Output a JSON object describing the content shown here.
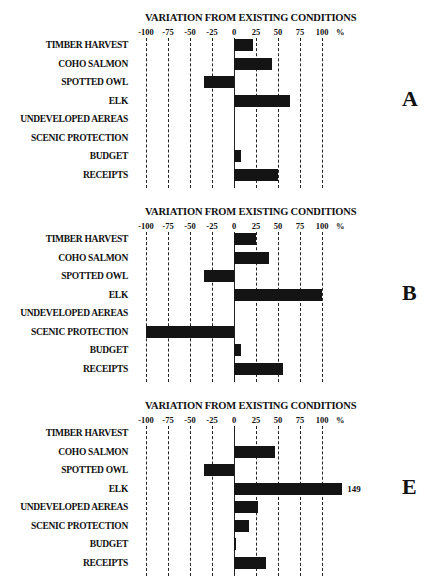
{
  "chart_data": [
    {
      "type": "bar",
      "orientation": "horizontal",
      "panel": "A",
      "title": "VARIATION FROM EXISTING CONDITIONS",
      "xlabel": "%",
      "xlim": [
        -100,
        100
      ],
      "xticks": [
        -100,
        -75,
        -50,
        -25,
        0,
        25,
        50,
        75,
        100
      ],
      "grid": "vertical dashed",
      "categories": [
        "TIMBER HARVEST",
        "COHO SALMON",
        "SPOTTED OWL",
        "ELK",
        "UNDEVELOPED AEREAS",
        "SCENIC PROTECTION",
        "BUDGET",
        "RECEIPTS"
      ],
      "values": [
        22,
        43,
        -34,
        64,
        0,
        0,
        8,
        50
      ]
    },
    {
      "type": "bar",
      "orientation": "horizontal",
      "panel": "B",
      "title": "VARIATION FROM EXISTING CONDITIONS",
      "xlabel": "%",
      "xlim": [
        -100,
        100
      ],
      "xticks": [
        -100,
        -75,
        -50,
        -25,
        0,
        25,
        50,
        75,
        100
      ],
      "grid": "vertical dashed",
      "categories": [
        "TIMBER HARVEST",
        "COHO SALMON",
        "SPOTTED OWL",
        "ELK",
        "UNDEVELOPED AEREAS",
        "SCENIC PROTECTION",
        "BUDGET",
        "RECEIPTS"
      ],
      "values": [
        25,
        40,
        -34,
        100,
        0,
        -100,
        8,
        56
      ]
    },
    {
      "type": "bar",
      "orientation": "horizontal",
      "panel": "E",
      "title": "VARIATION FROM EXISTING CONDITIONS",
      "xlabel": "%",
      "xlim": [
        -100,
        100
      ],
      "xticks": [
        -100,
        -75,
        -50,
        -25,
        0,
        25,
        50,
        75,
        100
      ],
      "grid": "vertical dashed",
      "categories": [
        "TIMBER HARVEST",
        "COHO SALMON",
        "SPOTTED OWL",
        "ELK",
        "UNDEVELOPED AEREAS",
        "SCENIC PROTECTION",
        "BUDGET",
        "RECEIPTS"
      ],
      "values": [
        0,
        47,
        -34,
        149,
        27,
        17,
        2,
        36
      ],
      "annotations": [
        {
          "category": "ELK",
          "text": "149",
          "note": "bar truncated beyond axis"
        }
      ]
    }
  ],
  "panels": [
    {
      "letter": "A",
      "title": "VARIATION FROM EXISTING CONDITIONS",
      "top": 0
    },
    {
      "letter": "B",
      "title": "VARIATION FROM EXISTING CONDITIONS",
      "top": 194
    },
    {
      "letter": "E",
      "title": "VARIATION FROM EXISTING CONDITIONS",
      "top": 388
    }
  ],
  "tick_labels": [
    "-100",
    "-75",
    "-50",
    "-25",
    "0",
    "25",
    "50",
    "75",
    "100"
  ],
  "unit_label": "%",
  "style": {
    "bar_color": "#141414",
    "grid_color": "#222222",
    "background": "#ffffff"
  }
}
